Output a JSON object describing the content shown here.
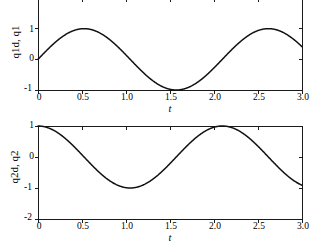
{
  "figure": {
    "background": "#ffffff",
    "line_color": "#111111",
    "axis_color": "#1a1a1a"
  },
  "chart_data": [
    {
      "id": "plot-top",
      "type": "line",
      "title": "",
      "xlabel": "t",
      "ylabel": "q1d, q1",
      "xlim": [
        0,
        3
      ],
      "ylim": [
        -1,
        2
      ],
      "xticks": [
        0,
        0.5,
        1.0,
        1.5,
        2.0,
        2.5,
        3.0
      ],
      "xticklabels": [
        "0",
        "0.5",
        "1.0",
        "1.5",
        "2.0",
        "2.5",
        "3.0"
      ],
      "yticks": [
        -1,
        0,
        1,
        2
      ],
      "yticklabels": [
        "-1",
        "0",
        "1",
        "2"
      ],
      "grid": false,
      "legend": "none",
      "note_top_clipped": true,
      "series": [
        {
          "name": "q1",
          "formula": "sin(3.0*t)",
          "x": [
            0,
            0.1,
            0.2,
            0.3,
            0.4,
            0.5,
            0.6,
            0.7,
            0.8,
            0.9,
            1.0,
            1.1,
            1.2,
            1.3,
            1.4,
            1.5,
            1.6,
            1.7,
            1.8,
            1.9,
            2.0,
            2.1,
            2.2,
            2.3,
            2.4,
            2.5,
            2.6,
            2.7,
            2.8,
            2.9,
            3.0
          ],
          "values": [
            0.0,
            0.296,
            0.565,
            0.783,
            0.932,
            0.997,
            0.973,
            0.863,
            0.675,
            0.427,
            0.141,
            -0.158,
            -0.443,
            -0.688,
            -0.872,
            -0.978,
            -0.996,
            -0.925,
            -0.772,
            -0.551,
            -0.279,
            0.021,
            0.316,
            0.579,
            0.793,
            0.938,
            0.999,
            0.969,
            0.857,
            0.665,
            0.412
          ]
        }
      ]
    },
    {
      "id": "plot-bottom",
      "type": "line",
      "title": "",
      "xlabel": "t",
      "ylabel": "q2d, q2",
      "xlim": [
        0,
        3
      ],
      "ylim": [
        -2,
        1
      ],
      "xticks": [
        0,
        0.5,
        1.0,
        1.5,
        2.0,
        2.5,
        3.0
      ],
      "xticklabels": [
        "0",
        "0.5",
        "1.0",
        "1.5",
        "2.0",
        "2.5",
        "3.0"
      ],
      "yticks": [
        -2,
        -1,
        0,
        1
      ],
      "yticklabels": [
        "-2",
        "-1",
        "0",
        "1"
      ],
      "grid": false,
      "legend": "none",
      "series": [
        {
          "name": "q2",
          "formula": "cos(3.0*t)",
          "x": [
            0,
            0.1,
            0.2,
            0.3,
            0.4,
            0.5,
            0.6,
            0.7,
            0.8,
            0.9,
            1.0,
            1.1,
            1.2,
            1.3,
            1.4,
            1.5,
            1.6,
            1.7,
            1.8,
            1.9,
            2.0,
            2.1,
            2.2,
            2.3,
            2.4,
            2.5,
            2.6,
            2.7,
            2.8,
            2.9,
            3.0
          ],
          "values": [
            1.0,
            0.955,
            0.825,
            0.622,
            0.362,
            0.071,
            -0.227,
            -0.505,
            -0.738,
            -0.904,
            -0.99,
            -0.987,
            -0.897,
            -0.726,
            -0.49,
            -0.21,
            0.087,
            0.378,
            0.635,
            0.834,
            0.96,
            1.0,
            0.949,
            0.815,
            0.609,
            0.347,
            0.054,
            -0.243,
            -0.519,
            -0.748,
            -0.911
          ]
        }
      ]
    }
  ]
}
